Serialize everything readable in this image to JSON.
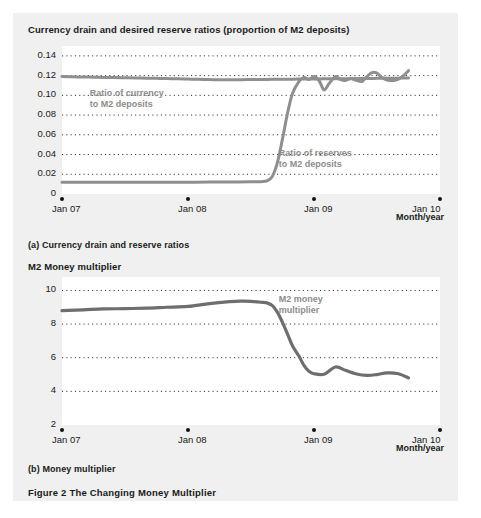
{
  "figure": {
    "caption": "Figure 2  The Changing Money Multiplier",
    "panel_a_caption": "(a) Currency drain and reserve ratios",
    "panel_b_caption": "(b) Money multiplier",
    "axis_name": "Month/year"
  },
  "chart_data": [
    {
      "type": "line",
      "title": "Currency drain and desired reserve ratios (proportion of M2 deposits)",
      "xlabel": "Month/year",
      "ylabel": "",
      "ylim": [
        0,
        0.15
      ],
      "yticks": [
        "0",
        "0.02",
        "0.04",
        "0.06",
        "0.08",
        "0.10",
        "0.12",
        "0.14"
      ],
      "ytickvalues": [
        0,
        0.02,
        0.04,
        0.06,
        0.08,
        0.1,
        0.12,
        0.14
      ],
      "xticks": [
        "Jan 07",
        "Jan 08",
        "Jan 09",
        "Jan 10"
      ],
      "xtickvalues": [
        2007.0,
        2008.0,
        2009.0,
        2010.0
      ],
      "xlim": [
        2007.0,
        2010.0
      ],
      "grid": "horizontal-dotted",
      "legend": "annotations",
      "annotations": [
        {
          "text_line1": "Ratio of currency",
          "text_line2": "to M2 deposits",
          "x": 2007.22,
          "y": 0.101
        },
        {
          "text_line1": "Ratio of reserves",
          "text_line2": "to M2 deposits",
          "x": 2008.72,
          "y": 0.041
        }
      ],
      "series": [
        {
          "name": "Ratio of currency to M2 deposits",
          "color": "#8f8f8f",
          "x": [
            2007.0,
            2007.08,
            2007.17,
            2007.25,
            2007.33,
            2007.42,
            2007.5,
            2007.58,
            2007.67,
            2007.75,
            2007.83,
            2007.92,
            2008.0,
            2008.08,
            2008.17,
            2008.25,
            2008.33,
            2008.42,
            2008.5,
            2008.58,
            2008.67,
            2008.75,
            2008.83,
            2008.92,
            2009.0,
            2009.08,
            2009.17,
            2009.25,
            2009.33,
            2009.42,
            2009.5,
            2009.58,
            2009.67,
            2009.75
          ],
          "values": [
            0.119,
            0.1188,
            0.1186,
            0.1184,
            0.1182,
            0.118,
            0.1178,
            0.1176,
            0.1174,
            0.1172,
            0.117,
            0.1168,
            0.1165,
            0.1162,
            0.116,
            0.1158,
            0.1158,
            0.1159,
            0.116,
            0.1161,
            0.1162,
            0.1163,
            0.1164,
            0.1165,
            0.1166,
            0.1167,
            0.1168,
            0.1169,
            0.117,
            0.1171,
            0.1172,
            0.1173,
            0.1174,
            0.1176
          ]
        },
        {
          "name": "Ratio of reserves to M2 deposits",
          "color": "#8f8f8f",
          "x": [
            2007.0,
            2007.17,
            2007.33,
            2007.5,
            2007.67,
            2007.83,
            2008.0,
            2008.17,
            2008.33,
            2008.5,
            2008.58,
            2008.63,
            2008.67,
            2008.71,
            2008.75,
            2008.79,
            2008.83,
            2008.88,
            2008.92,
            2008.96,
            2009.0,
            2009.04,
            2009.08,
            2009.12,
            2009.17,
            2009.21,
            2009.25,
            2009.29,
            2009.33,
            2009.38,
            2009.42,
            2009.46,
            2009.5,
            2009.54,
            2009.58,
            2009.63,
            2009.67,
            2009.71,
            2009.75
          ],
          "values": [
            0.012,
            0.012,
            0.012,
            0.012,
            0.012,
            0.012,
            0.012,
            0.0121,
            0.0122,
            0.0123,
            0.0125,
            0.0135,
            0.018,
            0.032,
            0.056,
            0.082,
            0.102,
            0.114,
            0.118,
            0.116,
            0.119,
            0.115,
            0.1055,
            0.112,
            0.119,
            0.116,
            0.115,
            0.117,
            0.1155,
            0.114,
            0.119,
            0.123,
            0.1225,
            0.118,
            0.1155,
            0.115,
            0.1165,
            0.12,
            0.125
          ]
        }
      ]
    },
    {
      "type": "line",
      "title": "M2 Money multiplier",
      "xlabel": "Month/year",
      "ylabel": "",
      "ylim": [
        2,
        10.8
      ],
      "yticks": [
        "2",
        "4",
        "6",
        "8",
        "10"
      ],
      "ytickvalues": [
        2,
        4,
        6,
        8,
        10
      ],
      "xticks": [
        "Jan 07",
        "Jan 08",
        "Jan 09",
        "Jan 10"
      ],
      "xtickvalues": [
        2007.0,
        2008.0,
        2009.0,
        2010.0
      ],
      "xlim": [
        2007.0,
        2010.0
      ],
      "grid": "horizontal-dotted",
      "legend": "annotations",
      "annotations": [
        {
          "text_line1": "M2 money",
          "text_line2": "multiplier",
          "x": 2008.72,
          "y": 9.45
        }
      ],
      "series": [
        {
          "name": "M2 money multiplier",
          "color": "#6e6e6e",
          "x": [
            2007.0,
            2007.17,
            2007.33,
            2007.5,
            2007.67,
            2007.83,
            2008.0,
            2008.17,
            2008.33,
            2008.42,
            2008.5,
            2008.58,
            2008.63,
            2008.67,
            2008.71,
            2008.75,
            2008.79,
            2008.83,
            2008.88,
            2008.92,
            2008.96,
            2009.0,
            2009.08,
            2009.17,
            2009.25,
            2009.33,
            2009.42,
            2009.5,
            2009.58,
            2009.67,
            2009.75
          ],
          "values": [
            8.8,
            8.85,
            8.9,
            8.92,
            8.95,
            9.0,
            9.05,
            9.22,
            9.33,
            9.36,
            9.35,
            9.3,
            9.25,
            9.1,
            8.7,
            8.1,
            7.4,
            6.7,
            6.1,
            5.55,
            5.2,
            5.05,
            5.02,
            5.45,
            5.25,
            5.05,
            4.95,
            5.0,
            5.1,
            5.05,
            4.8
          ]
        }
      ]
    }
  ]
}
